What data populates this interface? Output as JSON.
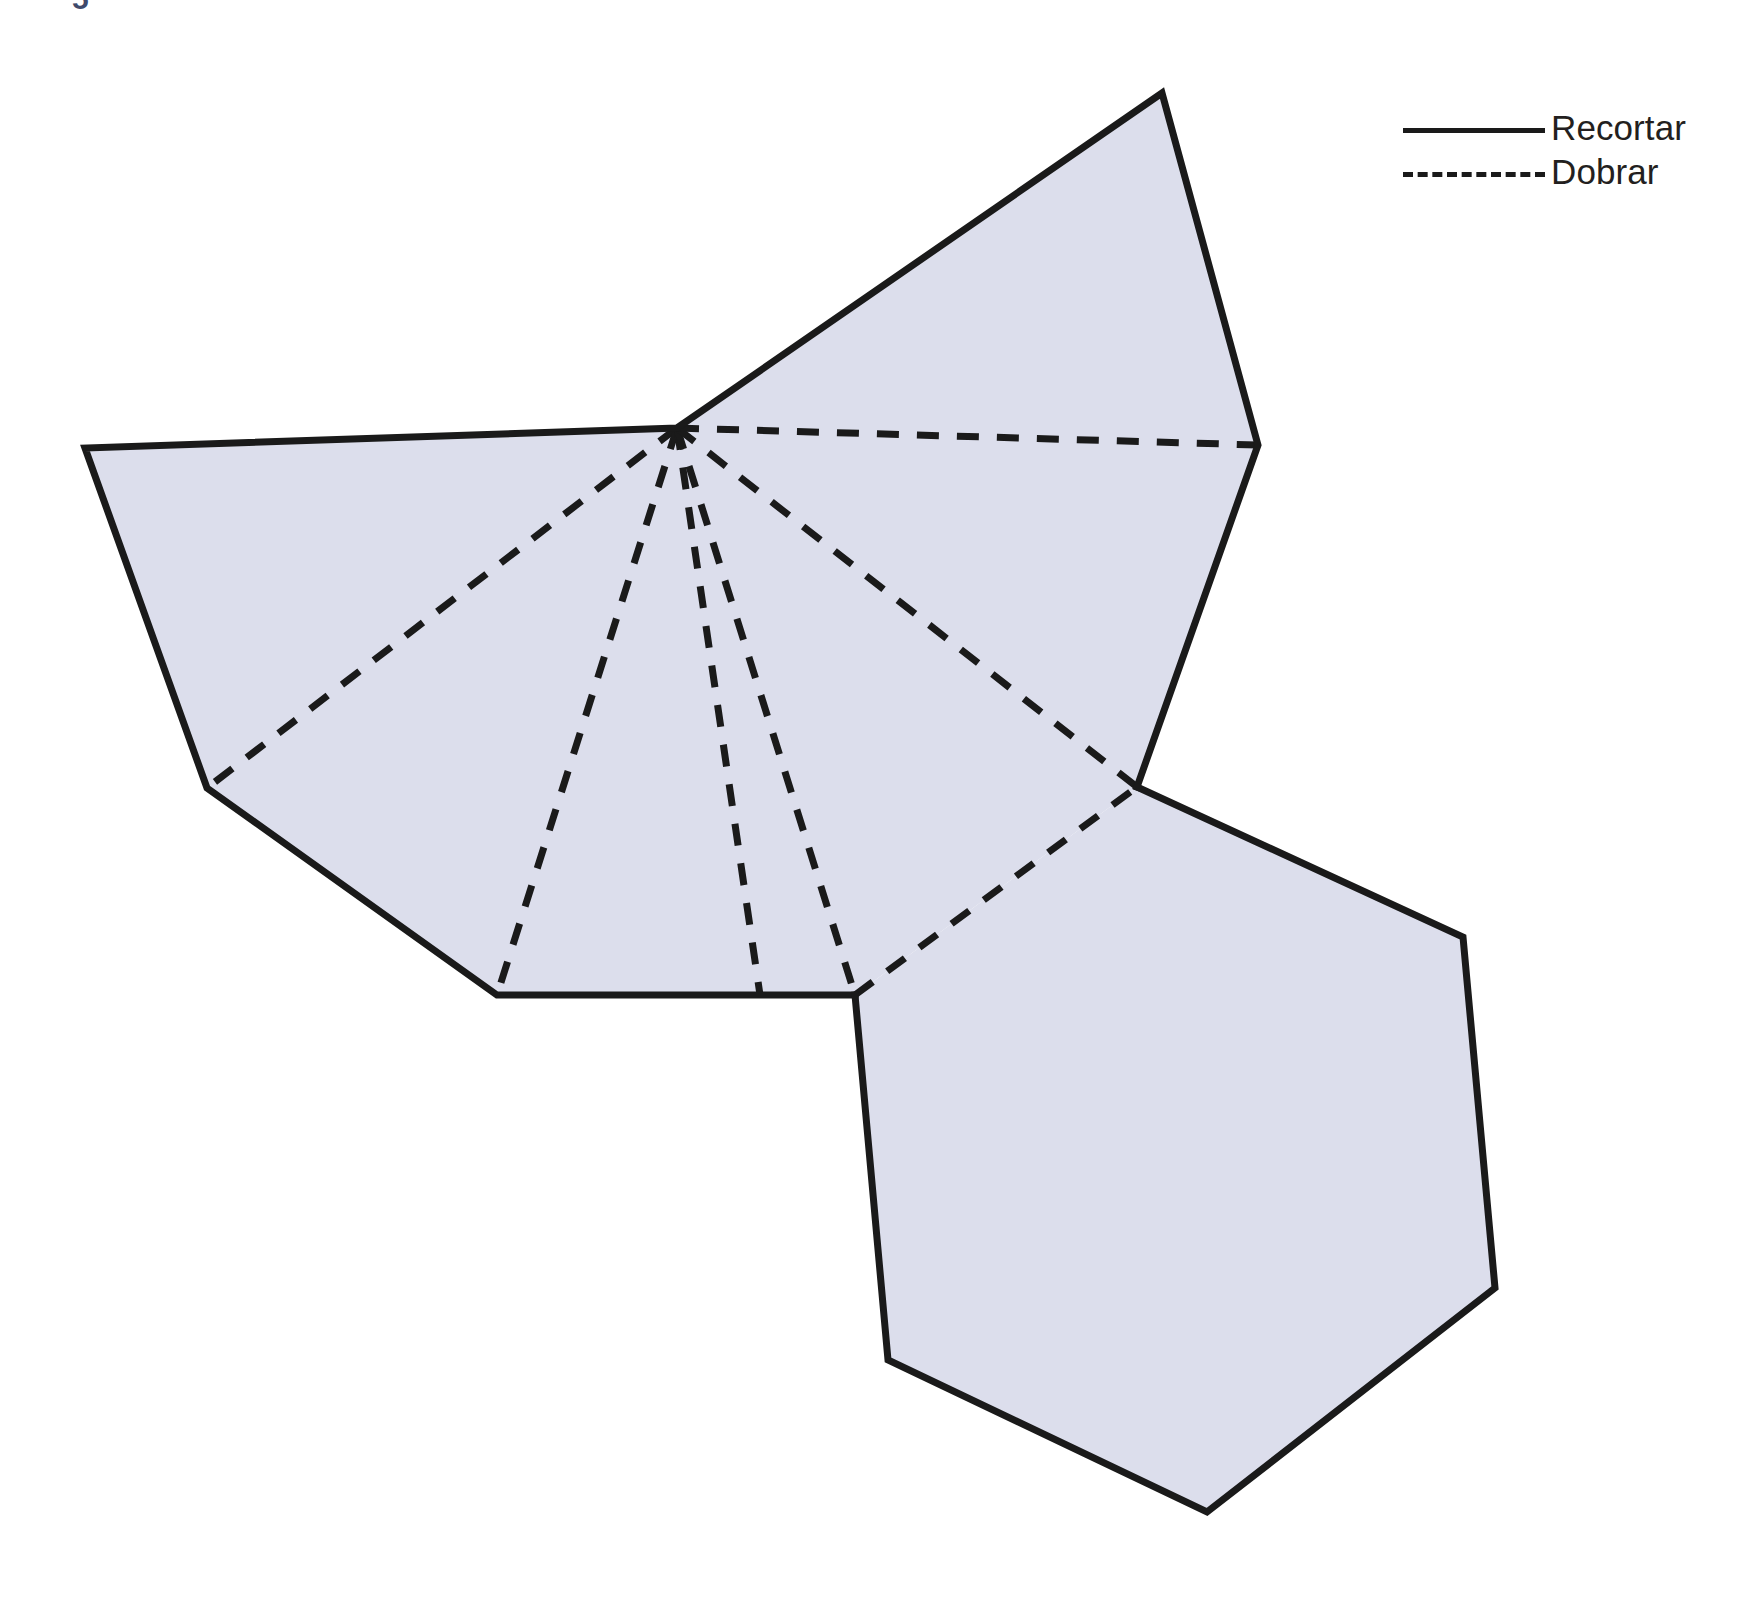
{
  "page": {
    "background_color": "#ffffff",
    "corner_mark": "5"
  },
  "legend": {
    "items": [
      {
        "label": "Recortar",
        "line_style": "solid",
        "color": "#1a1a1a",
        "swatch_name": "solid-line-swatch"
      },
      {
        "label": "Dobrar",
        "line_style": "dashed",
        "color": "#1a1a1a",
        "swatch_name": "dashed-line-swatch"
      }
    ]
  },
  "figure": {
    "name": "hexagonal-pyramid-net",
    "fill_color": "#dcdeec",
    "stroke_color": "#1a1a1a",
    "cut_stroke_width": 7,
    "fold_stroke_width": 7,
    "fold_dash_pattern": "22 18",
    "apex": {
      "x": 677,
      "y": 428
    },
    "cut_outline_top": "85,448 677,428 1162,93 1258,445 1137,787 855,995 497,995 207,788",
    "cut_outline_hexagon": "855,995 1137,787 1463,937 1495,1288 1207,1512 888,1360",
    "fold_lines": [
      {
        "name": "fold-to-left-vertex",
        "from": "677,428",
        "to": "207,788"
      },
      {
        "name": "fold-to-bottom-left",
        "from": "677,428",
        "to": "497,995"
      },
      {
        "name": "fold-to-bottom-mid",
        "from": "677,428",
        "to": "760,995"
      },
      {
        "name": "fold-to-bottom-right",
        "from": "677,428",
        "to": "855,995"
      },
      {
        "name": "fold-to-right-junction",
        "from": "677,428",
        "to": "1137,787"
      },
      {
        "name": "fold-to-top-right",
        "from": "677,428",
        "to": "1258,445"
      },
      {
        "name": "fold-hexagon-seam",
        "from": "855,995",
        "to": "1137,787"
      }
    ]
  }
}
